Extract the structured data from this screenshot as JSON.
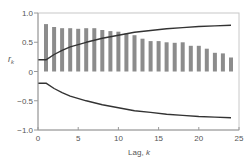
{
  "chart_data": {
    "type": "bar",
    "title": "",
    "xlabel": "Lag, k",
    "ylabel": "r_k",
    "ylabel_main": "r",
    "ylabel_sub": "k",
    "xlabel_main": "Lag, ",
    "xlabel_var": "k",
    "xlim": [
      0,
      25
    ],
    "ylim": [
      -1.0,
      1.0
    ],
    "xticks": [
      0,
      5,
      10,
      15,
      20,
      25
    ],
    "xtick_labels": [
      "0",
      "5",
      "10",
      "15",
      "20",
      "25"
    ],
    "yticks": [
      1.0,
      0.5,
      0,
      -0.5,
      -1.0
    ],
    "ytick_labels": [
      "1.0",
      "0.5",
      "0",
      "−0.5",
      "−1.0"
    ],
    "grid": false,
    "legend": null,
    "categories": [
      1,
      2,
      3,
      4,
      5,
      6,
      7,
      8,
      9,
      10,
      11,
      12,
      13,
      14,
      15,
      16,
      17,
      18,
      19,
      20,
      21,
      22,
      23,
      24
    ],
    "series": [
      {
        "name": "Sample autocorrelation r_k",
        "type": "bar",
        "color": "#8c8c8c",
        "values": [
          0.81,
          0.76,
          0.74,
          0.74,
          0.73,
          0.74,
          0.74,
          0.71,
          0.69,
          0.68,
          0.65,
          0.62,
          0.56,
          0.52,
          0.52,
          0.5,
          0.49,
          0.5,
          0.44,
          0.44,
          0.39,
          0.32,
          0.31,
          0.24
        ]
      },
      {
        "name": "Upper significance limit",
        "type": "line",
        "color": "#333333",
        "x": [
          0,
          1,
          2,
          3,
          4,
          6,
          8,
          10,
          12,
          14,
          16,
          18,
          20,
          22,
          24
        ],
        "values": [
          0.2,
          0.2,
          0.29,
          0.36,
          0.42,
          0.5,
          0.57,
          0.62,
          0.67,
          0.7,
          0.73,
          0.75,
          0.77,
          0.78,
          0.79
        ]
      },
      {
        "name": "Lower significance limit",
        "type": "line",
        "color": "#333333",
        "x": [
          0,
          1,
          2,
          3,
          4,
          6,
          8,
          10,
          12,
          14,
          16,
          18,
          20,
          22,
          24
        ],
        "values": [
          -0.2,
          -0.2,
          -0.29,
          -0.36,
          -0.42,
          -0.5,
          -0.57,
          -0.62,
          -0.67,
          -0.7,
          -0.73,
          -0.75,
          -0.77,
          -0.78,
          -0.79
        ]
      }
    ]
  }
}
